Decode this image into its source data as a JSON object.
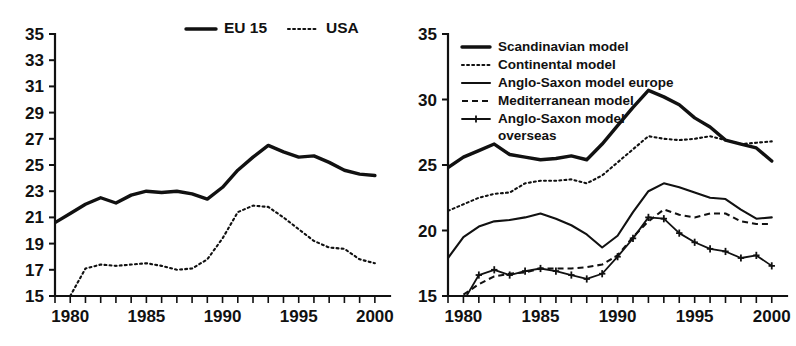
{
  "figure": {
    "title": "",
    "background_color": "#ffffff",
    "line_color": "#111111"
  },
  "chart_data": [
    {
      "id": "left",
      "type": "line",
      "title": "",
      "subtitle": "",
      "xlabel": "",
      "ylabel": "",
      "xlim": [
        1979,
        2000.6
      ],
      "ylim": [
        15,
        35
      ],
      "y_ticks": [
        15,
        17,
        19,
        21,
        23,
        25,
        27,
        29,
        31,
        33,
        35
      ],
      "y_tick_labels": [
        "15",
        "17",
        "19",
        "21",
        "23",
        "25",
        "27",
        "29",
        "31",
        "33",
        "35"
      ],
      "x_ticks": [
        1979,
        1980,
        1981,
        1982,
        1983,
        1984,
        1985,
        1986,
        1987,
        1988,
        1989,
        1990,
        1991,
        1992,
        1993,
        1994,
        1995,
        1996,
        1997,
        1998,
        1999,
        2000
      ],
      "x_tick_labels": [
        {
          "x": 1980,
          "label": "1980"
        },
        {
          "x": 1985,
          "label": "1985"
        },
        {
          "x": 1990,
          "label": "1990"
        },
        {
          "x": 1995,
          "label": "1995"
        },
        {
          "x": 2000,
          "label": "2000"
        }
      ],
      "grid": false,
      "legend_position": "top-center",
      "x": [
        1979,
        1980,
        1981,
        1982,
        1983,
        1984,
        1985,
        1986,
        1987,
        1988,
        1989,
        1990,
        1991,
        1992,
        1993,
        1994,
        1995,
        1996,
        1997,
        1998,
        1999,
        2000
      ],
      "series": [
        {
          "name": "EU 15",
          "style": "solid",
          "width": "thick",
          "marker": "none",
          "x": [
            1979,
            1980,
            1981,
            1982,
            1983,
            1984,
            1985,
            1986,
            1987,
            1988,
            1989,
            1990,
            1991,
            1992,
            1993,
            1994,
            1995,
            1996,
            1997,
            1998,
            1999,
            2000
          ],
          "values": [
            20.6,
            21.3,
            22.0,
            22.5,
            22.1,
            22.7,
            23.0,
            22.9,
            23.0,
            22.8,
            22.4,
            23.3,
            24.6,
            25.6,
            26.5,
            26.0,
            25.6,
            25.7,
            25.2,
            24.6,
            24.3,
            24.2,
            23.8,
            24.0
          ]
        },
        {
          "name": "USA",
          "style": "dotted",
          "width": "med",
          "marker": "none",
          "x": [
            1980,
            1981,
            1982,
            1983,
            1984,
            1985,
            1986,
            1987,
            1988,
            1989,
            1990,
            1991,
            1992,
            1993,
            1994,
            1995,
            1996,
            1997,
            1998,
            1999,
            2000
          ],
          "values": [
            15.0,
            17.1,
            17.4,
            17.3,
            17.4,
            17.5,
            17.3,
            17.0,
            17.1,
            17.8,
            19.4,
            21.4,
            21.9,
            21.8,
            21.0,
            20.1,
            19.2,
            18.7,
            18.6,
            17.8,
            17.5,
            17.5,
            17.8
          ]
        }
      ],
      "legend": [
        {
          "label": "EU 15",
          "style": "solid",
          "width": "thick"
        },
        {
          "label": "USA",
          "style": "dotted",
          "width": "med"
        }
      ]
    },
    {
      "id": "right",
      "type": "line",
      "title": "",
      "subtitle": "",
      "xlabel": "",
      "ylabel": "",
      "xlim": [
        1979,
        2000.6
      ],
      "ylim": [
        15,
        35
      ],
      "y_ticks": [
        15,
        20,
        25,
        30,
        35
      ],
      "y_tick_labels": [
        "15",
        "20",
        "25",
        "30",
        "35"
      ],
      "x_ticks": [
        1979,
        1980,
        1981,
        1982,
        1983,
        1984,
        1985,
        1986,
        1987,
        1988,
        1989,
        1990,
        1991,
        1992,
        1993,
        1994,
        1995,
        1996,
        1997,
        1998,
        1999,
        2000
      ],
      "x_tick_labels": [
        {
          "x": 1980,
          "label": "1980"
        },
        {
          "x": 1985,
          "label": "1985"
        },
        {
          "x": 1990,
          "label": "1990"
        },
        {
          "x": 1995,
          "label": "1995"
        },
        {
          "x": 2000,
          "label": "2000"
        }
      ],
      "grid": false,
      "legend_position": "top-left",
      "x": [
        1979,
        1980,
        1981,
        1982,
        1983,
        1984,
        1985,
        1986,
        1987,
        1988,
        1989,
        1990,
        1991,
        1992,
        1993,
        1994,
        1995,
        1996,
        1997,
        1998,
        1999,
        2000
      ],
      "series": [
        {
          "name": "Scandinavian model",
          "style": "solid",
          "width": "thick",
          "marker": "none",
          "x": [
            1979,
            1980,
            1981,
            1982,
            1983,
            1984,
            1985,
            1986,
            1987,
            1988,
            1989,
            1990,
            1991,
            1992,
            1993,
            1994,
            1995,
            1996,
            1997,
            1998,
            1999,
            2000
          ],
          "values": [
            24.8,
            25.6,
            26.1,
            26.6,
            25.8,
            25.6,
            25.4,
            25.5,
            25.7,
            25.4,
            26.6,
            28.0,
            29.4,
            30.7,
            30.2,
            29.6,
            28.6,
            27.9,
            26.9,
            26.6,
            26.3,
            25.3,
            25.6
          ]
        },
        {
          "name": "Continental model",
          "style": "dotted",
          "width": "med",
          "marker": "none",
          "x": [
            1979,
            1980,
            1981,
            1982,
            1983,
            1984,
            1985,
            1986,
            1987,
            1988,
            1989,
            1990,
            1991,
            1992,
            1993,
            1994,
            1995,
            1996,
            1997,
            1998,
            1999,
            2000
          ],
          "values": [
            21.5,
            22.0,
            22.5,
            22.8,
            22.9,
            23.6,
            23.8,
            23.8,
            23.9,
            23.6,
            24.2,
            25.2,
            26.2,
            27.2,
            27.0,
            26.9,
            27.0,
            27.2,
            26.9,
            26.6,
            26.7,
            26.8,
            27.0
          ]
        },
        {
          "name": "Anglo-Saxon model europe",
          "style": "solid",
          "width": "med",
          "marker": "none",
          "x": [
            1979,
            1980,
            1981,
            1982,
            1983,
            1984,
            1985,
            1986,
            1987,
            1988,
            1989,
            1990,
            1991,
            1992,
            1993,
            1994,
            1995,
            1996,
            1997,
            1998,
            1999,
            2000
          ],
          "values": [
            17.9,
            19.5,
            20.3,
            20.7,
            20.8,
            21.0,
            21.3,
            20.9,
            20.4,
            19.7,
            18.7,
            19.6,
            21.4,
            23.0,
            23.6,
            23.3,
            22.9,
            22.5,
            22.4,
            21.6,
            20.9,
            21.0,
            21.4
          ]
        },
        {
          "name": "Mediterranean model",
          "style": "dashed",
          "width": "med",
          "marker": "none",
          "x": [
            1980,
            1981,
            1982,
            1983,
            1984,
            1985,
            1986,
            1987,
            1988,
            1989,
            1990,
            1991,
            1992,
            1993,
            1994,
            1995,
            1996,
            1997,
            1998,
            1999,
            2000
          ],
          "values": [
            15.1,
            15.9,
            16.5,
            16.7,
            16.8,
            17.1,
            17.1,
            17.1,
            17.2,
            17.4,
            18.1,
            19.5,
            20.7,
            21.6,
            21.2,
            21.0,
            21.3,
            21.3,
            20.7,
            20.5,
            20.5,
            20.5
          ]
        },
        {
          "name": "Anglo-Saxon model overseas",
          "style": "solid",
          "width": "thin",
          "marker": "plus",
          "x": [
            1980,
            1981,
            1982,
            1983,
            1984,
            1985,
            1986,
            1987,
            1988,
            1989,
            1990,
            1991,
            1992,
            1993,
            1994,
            1995,
            1996,
            1997,
            1998,
            1999,
            2000
          ],
          "values": [
            14.6,
            16.6,
            17.0,
            16.6,
            16.9,
            17.1,
            16.9,
            16.6,
            16.3,
            16.7,
            18.0,
            19.4,
            21.0,
            20.9,
            19.8,
            19.1,
            18.6,
            18.4,
            17.9,
            18.1,
            17.3,
            17.3,
            17.8
          ]
        }
      ],
      "legend": [
        {
          "label": "Scandinavian model",
          "style": "solid",
          "width": "thick"
        },
        {
          "label": "Continental model",
          "style": "dotted",
          "width": "med"
        },
        {
          "label": "Anglo-Saxon model europe",
          "style": "solid",
          "width": "med"
        },
        {
          "label": "Mediterranean model",
          "style": "dashed",
          "width": "med"
        },
        {
          "label": "Anglo-Saxon model",
          "style": "solid-plus",
          "width": "thin",
          "label2": "overseas"
        }
      ]
    }
  ]
}
